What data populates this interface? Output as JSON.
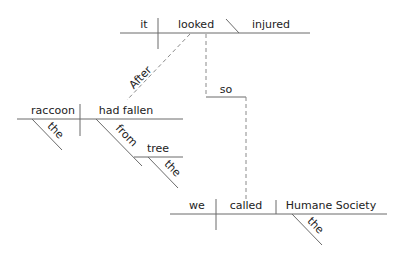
{
  "diagram": {
    "type": "sentence-diagram",
    "colors": {
      "line": "#6b6b6b",
      "dashed": "#8a8a8a",
      "text": "#222222"
    },
    "main_clause": {
      "subject": "it",
      "verb": "looked",
      "complement": "injured"
    },
    "subordinate_clause": {
      "conjunction": "After",
      "subject": "raccoon",
      "subject_modifier": "the",
      "verb": "had fallen",
      "preposition": "from",
      "object": "tree",
      "object_modifier": "the"
    },
    "coordinating_conjunction": "so",
    "second_clause": {
      "subject": "we",
      "verb": "called",
      "object": "Humane Society",
      "object_modifier": "the"
    }
  }
}
